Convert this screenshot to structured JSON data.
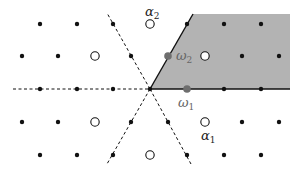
{
  "diagram": {
    "type": "weight-lattice",
    "origin": {
      "x": 150,
      "y": 89
    },
    "colors": {
      "chamber_fill": "#b3b3b3",
      "dot": "#111111",
      "fundamental_weight": "#6e6e6e",
      "line": "#111111",
      "background": "#ffffff"
    },
    "chamber": {
      "points": "150,89 193,14 290,14 290,89",
      "label": "fundamental Weyl chamber"
    },
    "walls": [
      {
        "name": "horizontal-dashed-wall",
        "x1": 13,
        "y1": 89,
        "x2": 150,
        "y2": 89,
        "style": "dashed"
      },
      {
        "name": "upleft-dashed-wall",
        "x1": 150,
        "y1": 89,
        "x2": 107,
        "y2": 13,
        "style": "dashed"
      },
      {
        "name": "downright-dashed-wall",
        "x1": 150,
        "y1": 89,
        "x2": 191,
        "y2": 164,
        "style": "dashed"
      },
      {
        "name": "downleft-dashed-wall",
        "x1": 150,
        "y1": 89,
        "x2": 107,
        "y2": 164,
        "style": "dashed"
      },
      {
        "name": "chamber-bottom-wall",
        "x1": 150,
        "y1": 89,
        "x2": 290,
        "y2": 89,
        "style": "solid"
      },
      {
        "name": "chamber-left-wall",
        "x1": 150,
        "y1": 89,
        "x2": 193,
        "y2": 14,
        "style": "solid"
      }
    ],
    "filled_dots": [
      [
        40,
        24
      ],
      [
        77,
        24
      ],
      [
        113,
        24
      ],
      [
        187,
        24
      ],
      [
        224,
        24
      ],
      [
        261,
        24
      ],
      [
        22,
        56
      ],
      [
        58,
        56
      ],
      [
        131,
        56
      ],
      [
        242,
        56
      ],
      [
        279,
        56
      ],
      [
        40,
        89
      ],
      [
        77,
        89
      ],
      [
        113,
        89
      ],
      [
        150,
        89
      ],
      [
        224,
        89
      ],
      [
        261,
        89
      ],
      [
        22,
        122
      ],
      [
        58,
        122
      ],
      [
        131,
        122
      ],
      [
        168,
        122
      ],
      [
        242,
        122
      ],
      [
        279,
        122
      ],
      [
        40,
        155
      ],
      [
        77,
        155
      ],
      [
        113,
        155
      ],
      [
        187,
        155
      ],
      [
        224,
        155
      ],
      [
        261,
        155
      ]
    ],
    "open_dots": [
      [
        150,
        24
      ],
      [
        95,
        56
      ],
      [
        205,
        56
      ],
      [
        95,
        122
      ],
      [
        205,
        122
      ],
      [
        150,
        155
      ]
    ],
    "weights": [
      {
        "name": "omega-2",
        "x": 168,
        "y": 56
      },
      {
        "name": "omega-1",
        "x": 187,
        "y": 89
      }
    ],
    "labels": {
      "alpha2": {
        "base": "α",
        "sub": "2"
      },
      "omega2": {
        "base": "ω",
        "sub": "2"
      },
      "omega1": {
        "base": "ω",
        "sub": "1"
      },
      "alpha1": {
        "base": "α",
        "sub": "1"
      }
    }
  }
}
